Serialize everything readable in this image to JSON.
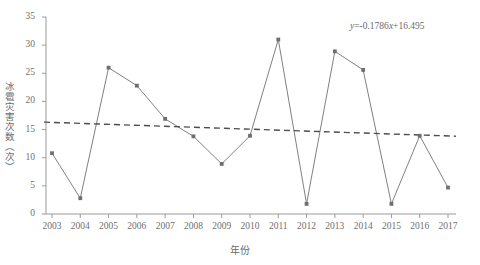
{
  "chart_data": {
    "type": "line",
    "title": "",
    "xlabel": "年份",
    "ylabel": "冰雹灾害次数（次）",
    "categories": [
      "2003",
      "2004",
      "2005",
      "2006",
      "2007",
      "2008",
      "2009",
      "2010",
      "2011",
      "2012",
      "2013",
      "2014",
      "2015",
      "2016",
      "2017"
    ],
    "values": [
      10.8,
      2.8,
      26.0,
      22.8,
      16.9,
      13.8,
      8.9,
      13.9,
      31.0,
      1.8,
      28.9,
      25.6,
      1.8,
      13.9,
      4.7
    ],
    "series": [
      {
        "name": "冰雹灾害次数",
        "values": [
          10.8,
          2.8,
          26.0,
          22.8,
          16.9,
          13.8,
          8.9,
          13.9,
          31.0,
          1.8,
          28.9,
          25.6,
          1.8,
          13.9,
          4.7
        ],
        "style": "solid",
        "marker": "square",
        "color": "#808080"
      },
      {
        "name": "线性趋势线",
        "style": "dashed",
        "marker": "none",
        "color": "#4d4d4d",
        "equation": "y=-0.1786x+16.495",
        "slope": -0.1786,
        "intercept": 16.495,
        "endpoints": [
          16.32,
          13.82
        ]
      }
    ],
    "ylim": [
      0,
      35
    ],
    "yticks": [
      0,
      5,
      10,
      15,
      20,
      25,
      30,
      35
    ],
    "ytick_labels": [
      "0",
      "5",
      "10",
      "15",
      "20",
      "25",
      "30",
      "35"
    ],
    "xticks": [
      "2003",
      "2004",
      "2005",
      "2006",
      "2007",
      "2008",
      "2009",
      "2010",
      "2011",
      "2012",
      "2013",
      "2014",
      "2015",
      "2016",
      "2017"
    ],
    "grid": false,
    "legend": "none",
    "annotations": [
      {
        "name": "trendline-equation",
        "text_plain": "y=-0.1786x+16.495",
        "y_symbol": "y",
        "body": "=-0.1786",
        "x_symbol": "x",
        "tail": "+16.495"
      }
    ],
    "colors": {
      "series_line": "#808080",
      "marker": "#6e6e6e",
      "trend_line": "#4d4d4d",
      "axis": "#9a9a9a",
      "text": "#6b6b6b",
      "background": "#ffffff"
    }
  }
}
